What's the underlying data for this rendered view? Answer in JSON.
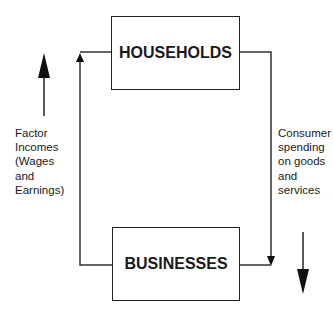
{
  "nodes": {
    "households": {
      "label": "HOUSEHOLDS"
    },
    "businesses": {
      "label": "BUSINESSES"
    }
  },
  "flows": {
    "left": {
      "label_lines": [
        "Factor",
        "Incomes",
        "(Wages",
        "and",
        "Earnings)"
      ],
      "direction": "up"
    },
    "right": {
      "label_lines": [
        "Consumer",
        "spending",
        "on goods",
        "and",
        "services"
      ],
      "direction": "down"
    }
  },
  "colors": {
    "line": "#222222",
    "text": "#1a1a1a",
    "background": "#ffffff"
  }
}
